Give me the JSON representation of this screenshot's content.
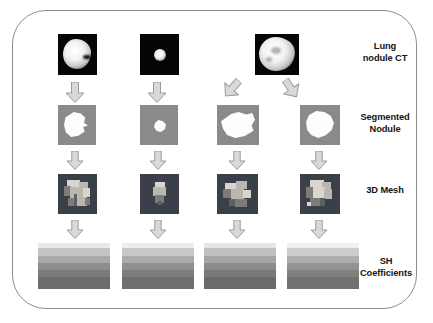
{
  "figure": {
    "border_color": "#8d8d8d",
    "background": "#ffffff"
  },
  "row_labels": [
    {
      "id": "lung-nodule-ct",
      "line1": "Lung",
      "line2": "nodule CT"
    },
    {
      "id": "segmented-nodule",
      "line1": "Segmented",
      "line2": "Nodule"
    },
    {
      "id": "3d-mesh",
      "line1": "3D Mesh",
      "line2": ""
    },
    {
      "id": "sh-coefficients",
      "line1": "SH",
      "line2": "Coefficients"
    }
  ],
  "stages": [
    {
      "id": "ct",
      "label": "Lung nodule CT",
      "background": "#050505",
      "count": 3
    },
    {
      "id": "segmentation",
      "label": "Segmented Nodule",
      "background": "#8a8a8a",
      "mask_color": "#fdfdfd",
      "count": 4
    },
    {
      "id": "mesh",
      "label": "3D Mesh",
      "background": "#3a3f4a",
      "count": 4
    },
    {
      "id": "sh",
      "label": "SH Coefficients",
      "count": 4
    }
  ],
  "columns": [
    {
      "index": 1,
      "ct": "large irregular bright nodule",
      "segmentation": "irregular polygonal mask",
      "mesh": "blocky voxel mesh",
      "sh": "banded coefficient map"
    },
    {
      "index": 2,
      "ct": "small round bright nodule",
      "segmentation": "small compact mask",
      "mesh": "tapered voxel mesh",
      "sh": "banded coefficient map"
    },
    {
      "index": 3,
      "ct": "",
      "segmentation": "wide lobulated mask",
      "mesh": "irregular voxel mesh",
      "sh": "banded coefficient map"
    },
    {
      "index": 4,
      "ct": "",
      "segmentation": "round lobulated mask",
      "mesh": "dense voxel mesh",
      "sh": "banded coefficient map"
    }
  ],
  "ct_images": [
    {
      "column": 1,
      "description": "large irregular bright nodule on black background"
    },
    {
      "column": 2,
      "description": "small round bright nodule on black background"
    },
    {
      "column": 3,
      "description": "lobulated bright nodule spanning columns 3 and 4, branches into two segmentations"
    }
  ],
  "arrows": {
    "fill": "#d9d9d9",
    "stroke": "#9a9a9a",
    "down": "down-arrow",
    "diagonal_left": "diagonal-down-left-arrow",
    "diagonal_right": "diagonal-down-right-arrow"
  },
  "chart_data": {
    "type": "heatmap",
    "title": "SH Coefficients",
    "xlabel": "",
    "ylabel": "",
    "band_count": 6,
    "series": [
      {
        "name": "Column 1",
        "values": [
          "#e8e8e8",
          "#c4c4c4",
          "#a9a9a9",
          "#8e8e8e",
          "#7b7b7b",
          "#6d6d6d"
        ]
      },
      {
        "name": "Column 2",
        "values": [
          "#ededed",
          "#c8c8c8",
          "#ababab",
          "#909090",
          "#7d7d7d",
          "#6f6f6f"
        ]
      },
      {
        "name": "Column 3",
        "values": [
          "#e4e4e4",
          "#c0c0c0",
          "#a6a6a6",
          "#8b8b8b",
          "#797979",
          "#6b6b6b"
        ]
      },
      {
        "name": "Column 4",
        "values": [
          "#f0f0f0",
          "#cccccc",
          "#aeaeae",
          "#939393",
          "#808080",
          "#717171"
        ]
      }
    ]
  }
}
